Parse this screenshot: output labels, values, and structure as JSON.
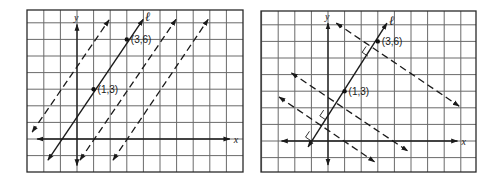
{
  "figures": [
    {
      "id": "left",
      "description": "Line l through (1,3) and (3,6) with parallel dashed lines",
      "frame": {
        "x": 27,
        "y": 10,
        "w": 216,
        "h": 162
      },
      "origin_px": {
        "x": 77,
        "y": 139
      },
      "unit_px": 16.6,
      "x_axis": {
        "from": -2.4,
        "to": 9.2,
        "label": "x"
      },
      "y_axis": {
        "from": -1.6,
        "to": 6.9,
        "label": "y"
      },
      "points": [
        {
          "label": "(1,3)",
          "x": 1,
          "y": 3
        },
        {
          "label": "(3,6)",
          "x": 3,
          "y": 6
        }
      ],
      "lines": [
        {
          "name": "parallel-dashed-1",
          "style": "dashed",
          "from": [
            -2.7,
            0.42
          ],
          "to": [
            1.93,
            7.17
          ],
          "arrows": "both"
        },
        {
          "name": "line-l",
          "style": "solid",
          "from": [
            -1.75,
            -1.27
          ],
          "to": [
            3.98,
            7.2
          ],
          "arrows": "both",
          "label": "ℓ"
        },
        {
          "name": "parallel-dashed-2",
          "style": "dashed",
          "from": [
            0.18,
            -1.27
          ],
          "to": [
            5.96,
            7.2
          ],
          "arrows": "both"
        },
        {
          "name": "parallel-dashed-3",
          "style": "dashed",
          "from": [
            2.17,
            -1.27
          ],
          "to": [
            7.9,
            7.2
          ],
          "arrows": "both"
        }
      ],
      "right_angles": []
    },
    {
      "id": "right",
      "description": "Line l through (1,3) and (3,6) with perpendicular dashed lines",
      "frame": {
        "x": 261,
        "y": 11,
        "w": 215,
        "h": 161
      },
      "origin_px": {
        "x": 328,
        "y": 141
      },
      "unit_px": 16.6,
      "x_axis": {
        "from": -2.8,
        "to": 7.8,
        "label": "x"
      },
      "y_axis": {
        "from": -1.45,
        "to": 7.1,
        "label": "y"
      },
      "points": [
        {
          "label": "(1,3)",
          "x": 1,
          "y": 3
        },
        {
          "label": "(3,6)",
          "x": 3,
          "y": 6
        }
      ],
      "lines": [
        {
          "name": "line-l",
          "style": "solid",
          "from": [
            -1.2,
            -0.36
          ],
          "to": [
            3.55,
            7.1
          ],
          "arrows": "both",
          "label": "ℓ"
        },
        {
          "name": "perpendicular-dashed-1",
          "style": "dashed",
          "from": [
            0.5,
            7.1
          ],
          "to": [
            7.9,
            2.1
          ],
          "arrows": "both"
        },
        {
          "name": "perpendicular-dashed-2",
          "style": "dashed",
          "from": [
            -2.2,
            4.1
          ],
          "to": [
            4.8,
            -0.6
          ],
          "arrows": "both"
        },
        {
          "name": "perpendicular-dashed-3",
          "style": "dashed",
          "from": [
            -2.95,
            2.65
          ],
          "to": [
            2.8,
            -1.25
          ],
          "arrows": "both"
        }
      ],
      "right_angles": [
        {
          "at": [
            2.64,
            5.46
          ]
        },
        {
          "at": [
            0.09,
            1.63
          ]
        },
        {
          "at": [
            -0.77,
            0.35
          ]
        }
      ]
    }
  ]
}
